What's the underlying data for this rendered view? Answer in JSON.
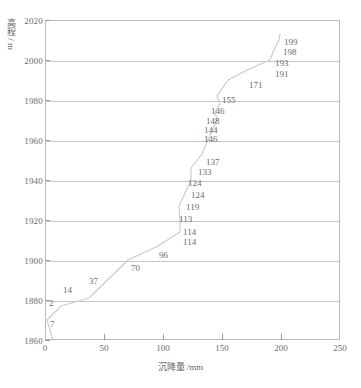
{
  "chart_data": {
    "type": "line",
    "title": "",
    "xlabel": "沉降量 /mm",
    "ylabel": "高程 / m",
    "xlim": [
      0,
      250
    ],
    "ylim": [
      1860,
      2020
    ],
    "grid": true,
    "legend": null,
    "xticks": [
      "0",
      "50",
      "100",
      "150",
      "200",
      "250"
    ],
    "yticks": [
      "1860",
      "1880",
      "1900",
      "1920",
      "1940",
      "1960",
      "1980",
      "2000",
      "2020"
    ],
    "series": [
      {
        "name": "settlement-profile",
        "x": [
          7,
          2,
          14,
          37,
          70,
          96,
          114,
          114,
          113,
          119,
          124,
          124,
          133,
          137,
          146,
          144,
          148,
          146,
          155,
          171,
          191,
          193,
          198,
          199
        ],
        "y": [
          1878,
          1882,
          1886,
          1893,
          1900,
          1907,
          1913,
          1916,
          1920,
          1925,
          1930,
          1934,
          1939,
          1943,
          1950,
          1954,
          1958,
          1962,
          1979,
          1985,
          1991,
          1994,
          2000,
          2003
        ],
        "labels": [
          "7",
          "2",
          "14",
          "37",
          "70",
          "96",
          "114",
          "114",
          "113",
          "119",
          "124",
          "124",
          "133",
          "137",
          "146",
          "144",
          "148",
          "146",
          "155",
          "171",
          "191",
          "193",
          "198",
          "199"
        ]
      }
    ],
    "point_labels": [
      {
        "text": "7",
        "x": 50,
        "y": 320
      },
      {
        "text": "2",
        "x": 49,
        "y": 299
      },
      {
        "text": "14",
        "x": 63,
        "y": 286
      },
      {
        "text": "37",
        "x": 89,
        "y": 277
      },
      {
        "text": "70",
        "x": 131,
        "y": 264
      },
      {
        "text": "96",
        "x": 159,
        "y": 251
      },
      {
        "text": "114",
        "x": 183,
        "y": 238
      },
      {
        "text": "114",
        "x": 183,
        "y": 228
      },
      {
        "text": "113",
        "x": 179,
        "y": 215
      },
      {
        "text": "119",
        "x": 186,
        "y": 203
      },
      {
        "text": "124",
        "x": 191,
        "y": 191
      },
      {
        "text": "124",
        "x": 188,
        "y": 179
      },
      {
        "text": "133",
        "x": 198,
        "y": 168
      },
      {
        "text": "137",
        "x": 206,
        "y": 158
      },
      {
        "text": "146",
        "x": 204,
        "y": 135
      },
      {
        "text": "144",
        "x": 204,
        "y": 126
      },
      {
        "text": "148",
        "x": 206,
        "y": 117
      },
      {
        "text": "146",
        "x": 211,
        "y": 107
      },
      {
        "text": "155",
        "x": 222,
        "y": 96
      },
      {
        "text": "171",
        "x": 249,
        "y": 81
      },
      {
        "text": "191",
        "x": 275,
        "y": 70
      },
      {
        "text": "193",
        "x": 275,
        "y": 59
      },
      {
        "text": "198",
        "x": 283,
        "y": 48
      },
      {
        "text": "199",
        "x": 284,
        "y": 38
      }
    ]
  },
  "axes": {
    "y_title": "高程 / m",
    "x_title": "沉降量 /mm",
    "y_ticks": [
      {
        "label": "2020",
        "value": 2020
      },
      {
        "label": "2000",
        "value": 2000
      },
      {
        "label": "1980",
        "value": 1980
      },
      {
        "label": "1960",
        "value": 1960
      },
      {
        "label": "1940",
        "value": 1940
      },
      {
        "label": "1920",
        "value": 1920
      },
      {
        "label": "1900",
        "value": 1900
      },
      {
        "label": "1880",
        "value": 1880
      },
      {
        "label": "1860",
        "value": 1860
      }
    ],
    "x_ticks": [
      {
        "label": "0",
        "value": 0
      },
      {
        "label": "50",
        "value": 50
      },
      {
        "label": "100",
        "value": 100
      },
      {
        "label": "150",
        "value": 150
      },
      {
        "label": "200",
        "value": 200
      },
      {
        "label": "250",
        "value": 250
      }
    ]
  },
  "style": {
    "curve_color": "#c9c9c9",
    "grid_color": "#c6c6c6",
    "frame_color": "#b9b9b9",
    "text_color": "#6b6b6b",
    "background": "#ffffff"
  }
}
